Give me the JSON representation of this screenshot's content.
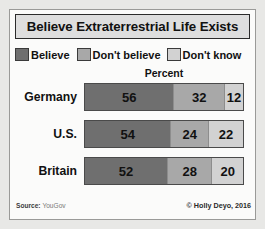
{
  "title": "Believe Extraterrestrial Life Exists",
  "percent_header": "Percent",
  "legend": [
    {
      "label": "Believe",
      "color": "#6f6f6f"
    },
    {
      "label": "Don't believe",
      "color": "#a8a8a8"
    },
    {
      "label": "Don't know",
      "color": "#d2d2d2"
    }
  ],
  "footer": {
    "source_label": "Source:",
    "source_value": "YouGov",
    "credit": "© Holly Deyo, 2016"
  },
  "chart_data": {
    "type": "bar",
    "orientation": "horizontal",
    "stacked": true,
    "title": "Believe Extraterrestrial Life Exists",
    "xlabel": "Percent",
    "ylabel": "",
    "xlim": [
      0,
      100
    ],
    "grid": false,
    "legend_position": "top",
    "categories": [
      "Germany",
      "U.S.",
      "Britain"
    ],
    "series": [
      {
        "name": "Believe",
        "color": "#6f6f6f",
        "values": [
          56,
          54,
          52
        ]
      },
      {
        "name": "Don't believe",
        "color": "#a8a8a8",
        "values": [
          32,
          24,
          28
        ]
      },
      {
        "name": "Don't know",
        "color": "#d2d2d2",
        "values": [
          12,
          22,
          20
        ]
      }
    ],
    "rows": [
      {
        "category": "Germany",
        "values": [
          56,
          32,
          12
        ]
      },
      {
        "category": "U.S.",
        "values": [
          54,
          24,
          22
        ]
      },
      {
        "category": "Britain",
        "values": [
          52,
          28,
          20
        ]
      }
    ]
  }
}
